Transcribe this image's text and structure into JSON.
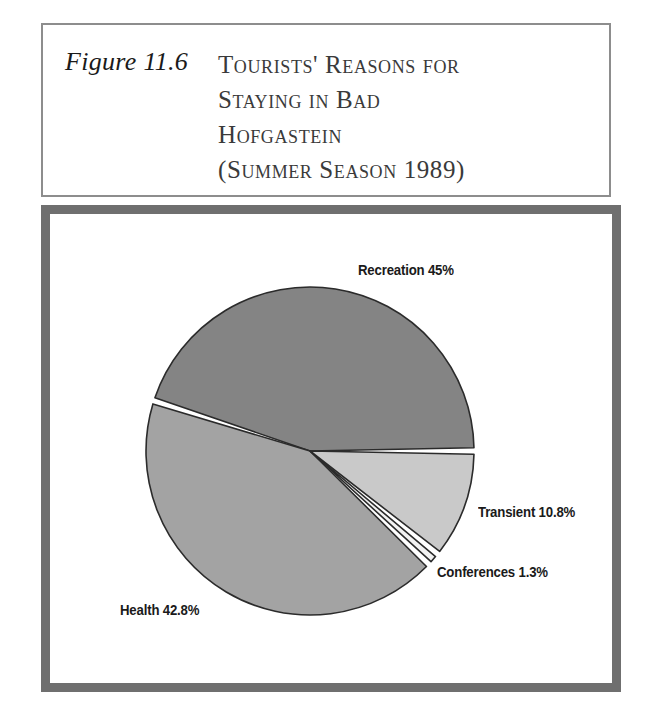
{
  "figure": {
    "number": "Figure 11.6",
    "title_lines": [
      "Tourists' Reasons for",
      "Staying in Bad",
      "Hofgastein",
      "(Summer Season 1989)"
    ],
    "frame_color": "#6f6f6f",
    "header_border_color": "#8d8d8d"
  },
  "chart_data": {
    "type": "pie",
    "title": "Tourists' Reasons for Staying in Bad Hofgastein (Summer Season 1989)",
    "categories": [
      "Recreation",
      "Health",
      "Conferences",
      "Transient"
    ],
    "values": [
      45,
      42.8,
      1.3,
      10.8
    ],
    "labels": [
      "Recreation 45%",
      "Health 42.8%",
      "Conferences 1.3%",
      "Transient 10.8%"
    ],
    "colors": [
      "#848484",
      "#a3a3a3",
      "#f2f2f2",
      "#c9c9c9"
    ],
    "slice_gap_color": "#ffffff",
    "outline_color": "#2b2b2b",
    "legend": "none",
    "units": "percent",
    "center": {
      "x": 310,
      "y": 451
    },
    "radius": 164,
    "start_angle_deg": 0,
    "direction": "counterclockwise"
  },
  "labels": {
    "recreation": "Recreation 45%",
    "transient": "Transient 10.8%",
    "conferences": "Conferences 1.3%",
    "health": "Health 42.8%"
  }
}
